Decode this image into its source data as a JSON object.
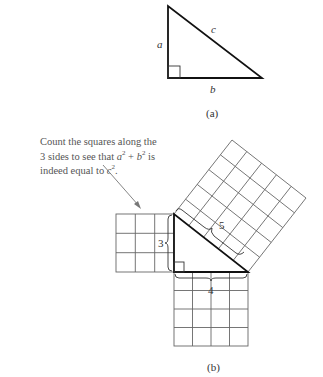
{
  "figure_a": {
    "label": "(a)",
    "side_a": "a",
    "side_b": "b",
    "side_c": "c"
  },
  "figure_b": {
    "label": "(b)",
    "caption": {
      "line1": "Count the squares along the",
      "line2_prefix": "3 sides to see that ",
      "line2_var_a": "a",
      "line2_plus": " + ",
      "line2_var_b": "b",
      "line2_suffix": " is",
      "line3_prefix": "indeed equal to ",
      "line3_var_c": "c",
      "line3_suffix": ".",
      "exponent": "2"
    },
    "side_labels": {
      "short": "3",
      "long": "4",
      "hypotenuse": "5"
    }
  },
  "colors": {
    "triangle_stroke": "#111111",
    "grid_stroke": "#666666",
    "text": "#333333",
    "caption_text": "#555555",
    "arrow": "#777777"
  }
}
